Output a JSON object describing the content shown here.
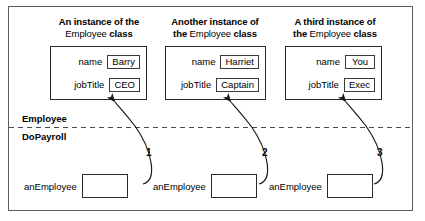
{
  "figure": {
    "scope_upper_label": "Employee",
    "scope_lower_label": "DoPayroll"
  },
  "instances": [
    {
      "heading_line1": "An instance of the",
      "heading_line2_pre": "",
      "heading_line2_class": "Employee",
      "heading_line2_post": "class",
      "fields": [
        {
          "label": "name",
          "value": "Barry"
        },
        {
          "label": "jobTitle",
          "value": "CEO"
        }
      ],
      "arrow_number": "1",
      "variable_name": "anEmployee",
      "variable_value": ""
    },
    {
      "heading_line1": "Another instance of",
      "heading_line2_pre": "the",
      "heading_line2_class": "Employee",
      "heading_line2_post": "class",
      "fields": [
        {
          "label": "name",
          "value": "Harriet"
        },
        {
          "label": "jobTitle",
          "value": "Captain"
        }
      ],
      "arrow_number": "2",
      "variable_name": "anEmployee",
      "variable_value": ""
    },
    {
      "heading_line1": "A third instance of",
      "heading_line2_pre": "the",
      "heading_line2_class": "Employee",
      "heading_line2_post": "class",
      "fields": [
        {
          "label": "name",
          "value": "You"
        },
        {
          "label": "jobTitle",
          "value": "Exec"
        }
      ],
      "arrow_number": "3",
      "variable_name": "anEmployee",
      "variable_value": ""
    }
  ],
  "colors": {
    "frame": "#5a5f63",
    "box_stroke": "#2b2b2b",
    "arrow": "#1a1a1a",
    "divider": "#4a4a4a",
    "background": "#ffffff"
  }
}
